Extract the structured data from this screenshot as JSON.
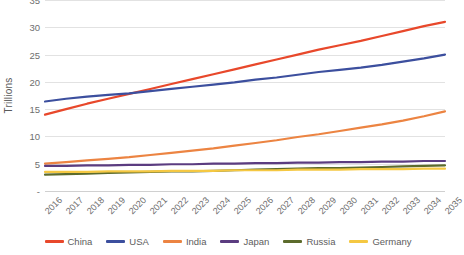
{
  "chart_data": {
    "type": "line",
    "title": "",
    "xlabel": "",
    "ylabel": "Trillions",
    "ylim": [
      0,
      35
    ],
    "y_ticks": [
      "-",
      "5",
      "10",
      "15",
      "20",
      "25",
      "30",
      "35"
    ],
    "y_tick_values": [
      0,
      5,
      10,
      15,
      20,
      25,
      30,
      35
    ],
    "grid": true,
    "legend_position": "bottom",
    "categories": [
      "2016",
      "2017",
      "2018",
      "2019",
      "2020",
      "2021",
      "2022",
      "2023",
      "2024",
      "2025",
      "2026",
      "2027",
      "2028",
      "2029",
      "2030",
      "2031",
      "2032",
      "2033",
      "2034",
      "2035"
    ],
    "series": [
      {
        "name": "China",
        "color": "#E8482B",
        "values": [
          14.0,
          15.0,
          16.0,
          16.9,
          17.8,
          18.7,
          19.6,
          20.5,
          21.4,
          22.3,
          23.2,
          24.1,
          25.0,
          25.9,
          26.7,
          27.5,
          28.4,
          29.3,
          30.2,
          31.0
        ]
      },
      {
        "name": "USA",
        "color": "#3C4F9E",
        "values": [
          16.4,
          16.9,
          17.3,
          17.6,
          17.9,
          18.3,
          18.7,
          19.1,
          19.5,
          19.9,
          20.4,
          20.8,
          21.3,
          21.8,
          22.2,
          22.6,
          23.1,
          23.7,
          24.3,
          25.0
        ]
      },
      {
        "name": "India",
        "color": "#EC8442",
        "values": [
          5.0,
          5.3,
          5.6,
          5.9,
          6.2,
          6.6,
          7.0,
          7.4,
          7.8,
          8.3,
          8.8,
          9.3,
          9.9,
          10.4,
          11.0,
          11.6,
          12.2,
          12.9,
          13.7,
          14.6
        ]
      },
      {
        "name": "Japan",
        "color": "#5B3C80",
        "values": [
          4.6,
          4.6,
          4.7,
          4.7,
          4.8,
          4.8,
          4.9,
          4.9,
          5.0,
          5.0,
          5.1,
          5.1,
          5.2,
          5.2,
          5.3,
          5.3,
          5.4,
          5.4,
          5.5,
          5.5
        ]
      },
      {
        "name": "Russia",
        "color": "#5C6B2C",
        "values": [
          3.0,
          3.1,
          3.2,
          3.3,
          3.4,
          3.5,
          3.6,
          3.6,
          3.7,
          3.8,
          3.9,
          4.0,
          4.1,
          4.2,
          4.2,
          4.3,
          4.4,
          4.5,
          4.6,
          4.7
        ]
      },
      {
        "name": "Germany",
        "color": "#F5C842",
        "values": [
          3.5,
          3.5,
          3.5,
          3.6,
          3.6,
          3.6,
          3.7,
          3.7,
          3.7,
          3.8,
          3.8,
          3.8,
          3.9,
          3.9,
          3.9,
          4.0,
          4.0,
          4.0,
          4.1,
          4.1
        ]
      }
    ]
  }
}
